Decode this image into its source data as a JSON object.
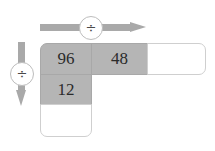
{
  "diagram": {
    "colors": {
      "cell_filled": "#b5b5b5",
      "cell_empty": "#ffffff",
      "arrow": "#a9a9a9",
      "border": "#c9c9c9",
      "text": "#2b2b2b"
    },
    "arrows": {
      "horizontal": {
        "direction": "right",
        "operator_label": "÷"
      },
      "vertical": {
        "direction": "down",
        "operator_label": "÷"
      }
    },
    "grid": {
      "rows": [
        {
          "cells": [
            {
              "value": "96",
              "state": "filled"
            },
            {
              "value": "48",
              "state": "filled"
            },
            {
              "value": "",
              "state": "empty"
            }
          ]
        },
        {
          "cells": [
            {
              "value": "12",
              "state": "filled"
            }
          ]
        },
        {
          "cells": [
            {
              "value": "",
              "state": "empty"
            }
          ]
        }
      ]
    }
  }
}
